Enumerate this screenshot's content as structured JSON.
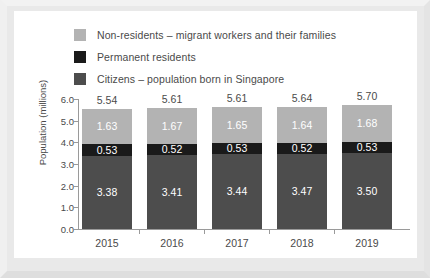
{
  "chart_data": {
    "type": "bar",
    "subtype": "stacked-vertical",
    "title": "",
    "xlabel": "",
    "ylabel": "Population (millions)",
    "ylim": [
      0.0,
      6.0
    ],
    "ytick_step": 1.0,
    "ytick_labels": [
      "6.0",
      "5.0",
      "4.0",
      "3.0",
      "2.0",
      "1.0",
      "0.0"
    ],
    "ytick_values": [
      6.0,
      5.0,
      4.0,
      3.0,
      2.0,
      1.0,
      0.0
    ],
    "grid": false,
    "legend_position": "top",
    "categories": [
      "2015",
      "2016",
      "2017",
      "2018",
      "2019"
    ],
    "series": [
      {
        "name": "Citizens – population born in Singapore",
        "key": "citizens",
        "color": "#4d4d4d",
        "label_color": "#ffffff",
        "values": [
          3.38,
          3.41,
          3.44,
          3.47,
          3.5
        ],
        "value_labels": [
          "3.38",
          "3.41",
          "3.44",
          "3.47",
          "3.50"
        ]
      },
      {
        "name": "Permanent residents",
        "key": "permanent_residents",
        "color": "#1a1a1a",
        "label_color": "#ffffff",
        "values": [
          0.53,
          0.52,
          0.53,
          0.52,
          0.53
        ],
        "value_labels": [
          "0.53",
          "0.52",
          "0.53",
          "0.52",
          "0.53"
        ]
      },
      {
        "name": "Non-residents – migrant workers and their families",
        "key": "non_residents",
        "color": "#b3b3b3",
        "label_color": "#ffffff",
        "values": [
          1.63,
          1.67,
          1.65,
          1.64,
          1.68
        ],
        "value_labels": [
          "1.63",
          "1.67",
          "1.65",
          "1.64",
          "1.68"
        ]
      }
    ],
    "totals": [
      5.54,
      5.61,
      5.61,
      5.64,
      5.7
    ],
    "total_labels": [
      "5.54",
      "5.61",
      "5.61",
      "5.64",
      "5.70"
    ],
    "stack_order_bottom_to_top": [
      "citizens",
      "permanent_residents",
      "non_residents"
    ]
  },
  "legend": {
    "items": [
      {
        "label": "Non-residents – migrant workers and their families",
        "color": "#b3b3b3"
      },
      {
        "label": "Permanent residents",
        "color": "#1a1a1a"
      },
      {
        "label": "Citizens – population born in Singapore",
        "color": "#4d4d4d"
      }
    ]
  },
  "colors": {
    "page_background": "#e9e9e9",
    "card_background": "#ffffff",
    "axis": "#9a9a9a",
    "text": "#4a4a4a"
  }
}
